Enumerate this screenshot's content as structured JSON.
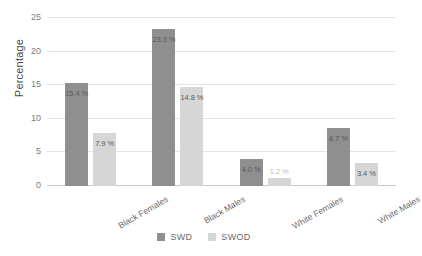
{
  "chart_data": {
    "type": "bar",
    "title": "",
    "xlabel": "",
    "ylabel": "Percentage",
    "ylim": [
      0,
      25
    ],
    "yticks": [
      0,
      5,
      10,
      15,
      20,
      25
    ],
    "ytick_labels": [
      "0",
      "5",
      "10",
      "15",
      "20",
      "25"
    ],
    "grid": true,
    "legend_position": "bottom",
    "categories": [
      "Black Females",
      "Black Males",
      "White Females",
      "White Males"
    ],
    "series": [
      {
        "name": "SWD",
        "color": "#8f8f8f",
        "values": [
          15.4,
          23.3,
          4.0,
          8.7
        ],
        "labels": [
          "15.4 %",
          "23.3 %",
          "4.0 %",
          "8.7 %"
        ]
      },
      {
        "name": "SWOD",
        "color": "#d6d6d6",
        "values": [
          7.9,
          14.8,
          1.2,
          3.4
        ],
        "labels": [
          "7.9 %",
          "14.8 %",
          "1.2 %",
          "3.4 %"
        ]
      }
    ]
  },
  "axis": {
    "y_title": "Percentage"
  },
  "legend": {
    "items": [
      {
        "label": "SWD",
        "color": "#8f8f8f"
      },
      {
        "label": "SWOD",
        "color": "#d6d6d6"
      }
    ]
  }
}
